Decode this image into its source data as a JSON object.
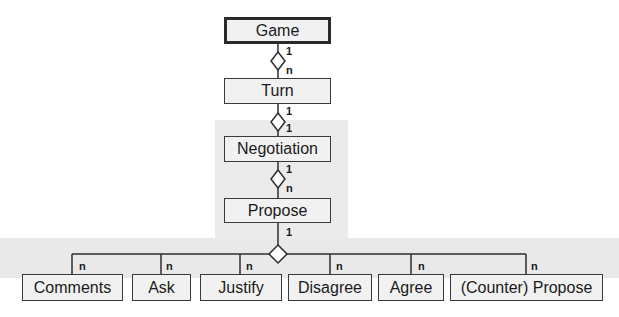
{
  "diagram": {
    "type": "uml-aggregation-hierarchy",
    "nodes": {
      "game": "Game",
      "turn": "Turn",
      "negotiation": "Negotiation",
      "propose": "Propose",
      "comments": "Comments",
      "ask": "Ask",
      "justify": "Justify",
      "disagree": "Disagree",
      "agree": "Agree",
      "counter_propose": "(Counter) Propose"
    },
    "edges": [
      {
        "from": "Game",
        "to": "Turn",
        "from_mult": "1",
        "to_mult": "n"
      },
      {
        "from": "Turn",
        "to": "Negotiation",
        "from_mult": "1",
        "to_mult": "1"
      },
      {
        "from": "Negotiation",
        "to": "Propose",
        "from_mult": "1",
        "to_mult": "n"
      },
      {
        "from": "Propose",
        "to": "Comments",
        "from_mult": "1",
        "to_mult": "n"
      },
      {
        "from": "Propose",
        "to": "Ask",
        "from_mult": "1",
        "to_mult": "n"
      },
      {
        "from": "Propose",
        "to": "Justify",
        "from_mult": "1",
        "to_mult": "n"
      },
      {
        "from": "Propose",
        "to": "Disagree",
        "from_mult": "1",
        "to_mult": "n"
      },
      {
        "from": "Propose",
        "to": "Agree",
        "from_mult": "1",
        "to_mult": "n"
      },
      {
        "from": "Propose",
        "to": "(Counter) Propose",
        "from_mult": "1",
        "to_mult": "n"
      }
    ],
    "multiplicities": {
      "game_turn_top": "1",
      "game_turn_bottom": "n",
      "turn_neg_top": "1",
      "turn_neg_bottom": "1",
      "neg_prop_top": "1",
      "neg_prop_bottom": "n",
      "prop_children_top": "1",
      "child_n": "n"
    }
  }
}
